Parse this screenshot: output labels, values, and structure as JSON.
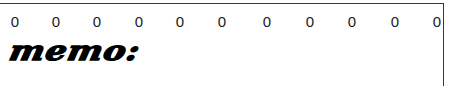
{
  "frame": {
    "border_color": "#3a3a3a"
  },
  "zero_row": {
    "values": [
      "0",
      "0",
      "0",
      "0",
      "0",
      "0",
      "0",
      "0",
      "0",
      "0",
      "0"
    ]
  },
  "memo": {
    "label": "memo:"
  }
}
